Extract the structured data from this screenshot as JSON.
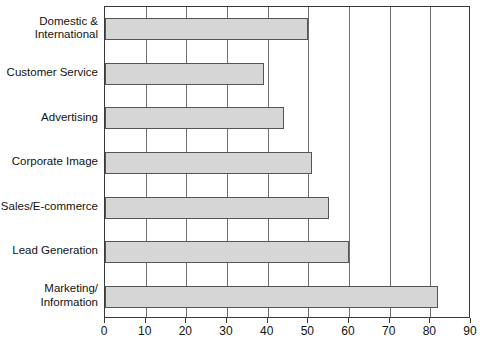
{
  "chart_data": {
    "type": "bar",
    "orientation": "horizontal",
    "title": "",
    "xlabel": "",
    "ylabel": "",
    "categories": [
      "Domestic &\nInternational",
      "Customer Service",
      "Advertising",
      "Corporate Image",
      "Sales/E-commerce",
      "Lead Generation",
      "Marketing/\nInformation"
    ],
    "values": [
      50,
      39,
      44,
      51,
      55,
      60,
      82
    ],
    "xlim": [
      0,
      90
    ],
    "xticks": [
      0,
      10,
      20,
      30,
      40,
      50,
      60,
      70,
      80,
      90
    ],
    "xtick_labels": [
      "0",
      "10",
      "20",
      "30",
      "40",
      "50",
      "60",
      "70",
      "80",
      "90"
    ],
    "grid": true,
    "grid_axis": "x",
    "legend": null,
    "bar_color": "#d6d6d6",
    "bar_border_color": "#555555",
    "frame_color": "#3a3a3a",
    "gridline_color": "#6e6e6e"
  }
}
